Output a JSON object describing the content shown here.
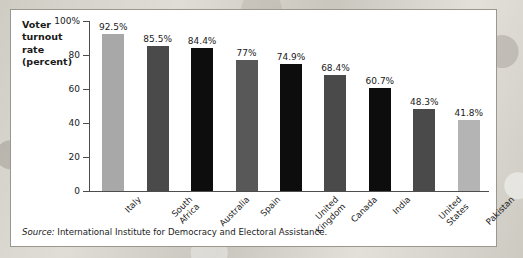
{
  "panel": {
    "title": "Voter\nturnout\nrate\n(percent)",
    "source_label": "Source:",
    "source_text": " International Institute for Democracy and Electoral Assistance."
  },
  "chart_data": {
    "type": "bar",
    "title": "Voter turnout rate (percent)",
    "xlabel": "",
    "ylabel": "Voter turnout rate (percent)",
    "ylim": [
      0,
      100
    ],
    "grid": false,
    "legend": "none",
    "ytick_labels": [
      "100%",
      "80",
      "60",
      "40",
      "20",
      "0"
    ],
    "ytick_values": [
      100,
      80,
      60,
      40,
      20,
      0
    ],
    "categories": [
      "Italy",
      "South\nAfrica",
      "Australia",
      "Spain",
      "United\nKingdom",
      "Canada",
      "India",
      "United\nStates",
      "Pakistan"
    ],
    "values": [
      92.5,
      85.5,
      84.4,
      77,
      74.9,
      68.4,
      60.7,
      48.3,
      41.8
    ],
    "value_labels": [
      "92.5%",
      "85.5%",
      "84.4%",
      "77%",
      "74.9%",
      "68.4%",
      "60.7%",
      "48.3%",
      "41.8%"
    ],
    "bar_colors": [
      "#a8a8a8",
      "#4a4a4a",
      "#0d0d0d",
      "#585858",
      "#0d0d0d",
      "#4a4a4a",
      "#0d0d0d",
      "#4a4a4a",
      "#b4b4b4"
    ]
  },
  "colors": {
    "panel_background": "#ffffff",
    "panel_border": "#9a978f",
    "axis": "#4d4d4d",
    "text": "#1a1a1a",
    "page_background": "#d9d6cf"
  }
}
